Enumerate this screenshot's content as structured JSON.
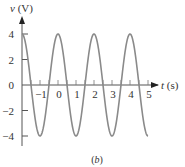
{
  "chart_data": {
    "type": "line",
    "title": "",
    "caption": "(b)",
    "xlabel": "t (s)",
    "ylabel": "v (V)",
    "xlim": [
      -2,
      5
    ],
    "ylim": [
      -4,
      4
    ],
    "x_ticks": [
      -1,
      0,
      1,
      2,
      3,
      4,
      5
    ],
    "y_ticks": [
      -4,
      -2,
      0,
      2,
      4
    ],
    "x_tick_labels": [
      "−1",
      "0",
      "1",
      "2",
      "3",
      "4",
      "5"
    ],
    "y_tick_labels": [
      "−4",
      "−2",
      "0",
      "2",
      "4"
    ],
    "grid": false,
    "legend": null,
    "series": [
      {
        "name": "v(t) = 4cos(πt)",
        "color": "#888888",
        "x": [
          -2,
          -1.5,
          -1,
          -0.5,
          0,
          0.5,
          1,
          1.5,
          2,
          2.5,
          3,
          3.5,
          4,
          4.5,
          5
        ],
        "values": [
          4,
          0,
          -4,
          0,
          4,
          0,
          -4,
          0,
          4,
          0,
          -4,
          0,
          4,
          0,
          -4
        ]
      }
    ],
    "amplitude": 4,
    "period": 2
  }
}
